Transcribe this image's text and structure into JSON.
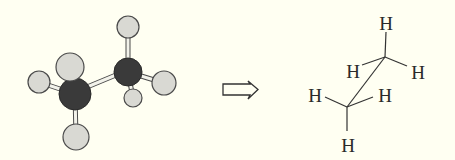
{
  "colors": {
    "background": "#fffff2",
    "carbon": "#3a3a3a",
    "hydrogen": "#d9d9d3",
    "outline": "#4a4a4a",
    "bond": "#f2f2ea",
    "line": "#333333"
  },
  "ball_and_stick": {
    "molecule": "ethane",
    "atoms": [
      {
        "id": "H1",
        "element": "H",
        "cx": 128,
        "cy": 27,
        "r": 11
      },
      {
        "id": "H2",
        "element": "H",
        "cx": 39,
        "cy": 82,
        "r": 11
      },
      {
        "id": "H3",
        "element": "H",
        "cx": 164,
        "cy": 83,
        "r": 12
      },
      {
        "id": "H4",
        "element": "H",
        "cx": 133,
        "cy": 98,
        "r": 9
      },
      {
        "id": "H5",
        "element": "H",
        "cx": 70,
        "cy": 67,
        "r": 14
      },
      {
        "id": "C2",
        "element": "C",
        "cx": 128,
        "cy": 72,
        "r": 14
      },
      {
        "id": "C1",
        "element": "C",
        "cx": 75,
        "cy": 94,
        "r": 16
      },
      {
        "id": "H6",
        "element": "H",
        "cx": 76,
        "cy": 137,
        "r": 13
      }
    ]
  },
  "arrow": {
    "label": "converts-to",
    "direction": "right"
  },
  "line_structure": {
    "atom_label": "H",
    "labels": [
      {
        "text": "H",
        "x": 386,
        "y": 30
      },
      {
        "text": "H",
        "x": 353,
        "y": 78
      },
      {
        "text": "H",
        "x": 418,
        "y": 79
      },
      {
        "text": "H",
        "x": 315,
        "y": 102
      },
      {
        "text": "H",
        "x": 385,
        "y": 102
      },
      {
        "text": "H",
        "x": 348,
        "y": 152
      }
    ]
  }
}
